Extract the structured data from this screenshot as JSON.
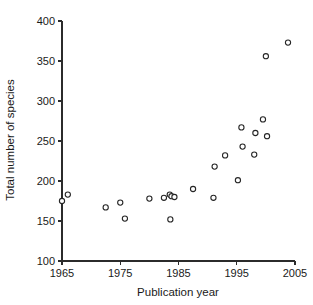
{
  "chart_data": {
    "type": "scatter",
    "title": "",
    "xlabel": "Publication year",
    "ylabel": "Total number of species",
    "xlim": [
      1965,
      2005
    ],
    "ylim": [
      100,
      400
    ],
    "xticks": [
      1965,
      1975,
      1985,
      1995,
      2005
    ],
    "yticks": [
      100,
      150,
      200,
      250,
      300,
      350,
      400
    ],
    "grid": false,
    "legend": null,
    "marker": "open-circle",
    "points": [
      {
        "x": 1965.0,
        "y": 175
      },
      {
        "x": 1966.0,
        "y": 183
      },
      {
        "x": 1972.5,
        "y": 167
      },
      {
        "x": 1975.0,
        "y": 173
      },
      {
        "x": 1975.8,
        "y": 153
      },
      {
        "x": 1980.0,
        "y": 178
      },
      {
        "x": 1982.5,
        "y": 179
      },
      {
        "x": 1983.5,
        "y": 183
      },
      {
        "x": 1983.8,
        "y": 181
      },
      {
        "x": 1983.6,
        "y": 152
      },
      {
        "x": 1984.3,
        "y": 180
      },
      {
        "x": 1987.5,
        "y": 190
      },
      {
        "x": 1991.0,
        "y": 179
      },
      {
        "x": 1991.2,
        "y": 218
      },
      {
        "x": 1993.0,
        "y": 232
      },
      {
        "x": 1995.2,
        "y": 201
      },
      {
        "x": 1995.8,
        "y": 267
      },
      {
        "x": 1996.0,
        "y": 243
      },
      {
        "x": 1998.0,
        "y": 233
      },
      {
        "x": 1998.2,
        "y": 260
      },
      {
        "x": 1999.5,
        "y": 277
      },
      {
        "x": 2000.2,
        "y": 256
      },
      {
        "x": 2000.0,
        "y": 356
      },
      {
        "x": 2003.8,
        "y": 373
      }
    ]
  }
}
